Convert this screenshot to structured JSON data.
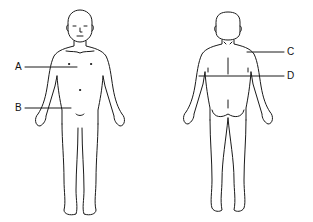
{
  "diagram": {
    "title": "",
    "figures": [
      {
        "view": "front",
        "description": "Anterior view of human body"
      },
      {
        "view": "back",
        "description": "Posterior view of human body"
      }
    ],
    "labels": [
      {
        "id": "A",
        "text": "A",
        "side": "left",
        "figure": "front"
      },
      {
        "id": "B",
        "text": "B",
        "side": "left",
        "figure": "front"
      },
      {
        "id": "C",
        "text": "C",
        "side": "right",
        "figure": "back"
      },
      {
        "id": "D",
        "text": "D",
        "side": "right",
        "figure": "back"
      }
    ],
    "colors": {
      "line": "#1a1a1a",
      "background": "#ffffff"
    }
  }
}
